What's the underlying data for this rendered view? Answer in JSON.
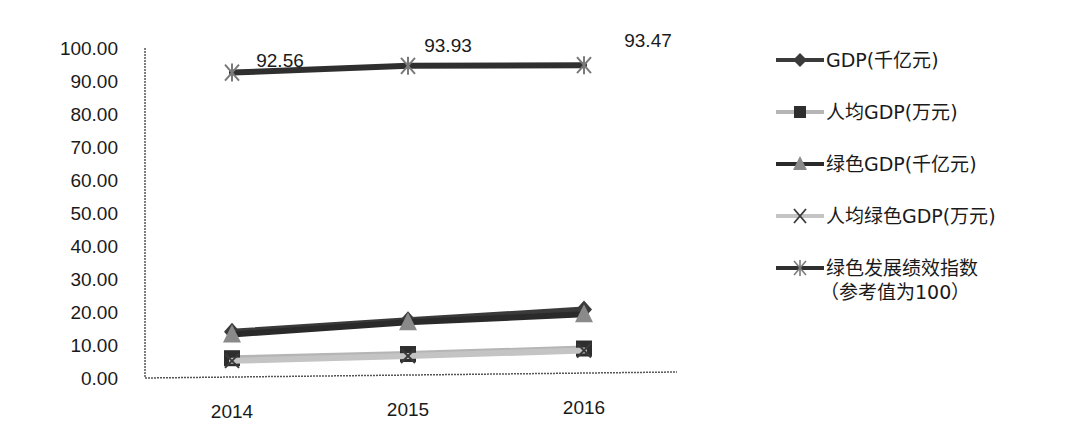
{
  "chart_data": {
    "type": "line",
    "title": "",
    "xlabel": "",
    "ylabel": "",
    "categories": [
      "2014",
      "2015",
      "2016"
    ],
    "ylim": [
      0,
      100
    ],
    "yticks": [
      "0.00",
      "10.00",
      "20.00",
      "30.00",
      "40.00",
      "50.00",
      "60.00",
      "70.00",
      "80.00",
      "90.00",
      "100.00"
    ],
    "grid": false,
    "legend_position": "right",
    "series": [
      {
        "name": "GDP(千亿元)",
        "marker": "diamond",
        "color": "#3a3a3a",
        "values": [
          14.0,
          16.8,
          19.4
        ]
      },
      {
        "name": "人均GDP(万元)",
        "marker": "square",
        "color": "#b5b5b5",
        "marker_color": "#2e2e2e",
        "values": [
          6.0,
          6.6,
          7.6
        ]
      },
      {
        "name": "绿色GDP(千亿元)",
        "marker": "triangle",
        "color": "#2a2a2a",
        "marker_color": "#8a8a8a",
        "values": [
          13.2,
          16.2,
          18.0
        ]
      },
      {
        "name": "人均绿色GDP(万元)",
        "marker": "x",
        "color": "#c4c4c4",
        "marker_color": "#3a3a3a",
        "values": [
          5.2,
          6.0,
          7.0
        ]
      },
      {
        "name": "绿色发展绩效指数（参考值为100）",
        "marker": "star",
        "color": "#2f2f2f",
        "marker_color": "#7a7a7a",
        "values": [
          92.56,
          93.93,
          93.47
        ],
        "data_labels": [
          "92.56",
          "93.93",
          "93.47"
        ]
      }
    ]
  },
  "legend": {
    "items": [
      {
        "label": "GDP(千亿元)"
      },
      {
        "label": "人均GDP(万元)"
      },
      {
        "label": "绿色GDP(千亿元)"
      },
      {
        "label": "人均绿色GDP(万元)"
      },
      {
        "label": "绿色发展绩效指数",
        "sublabel": "（参考值为100）"
      }
    ]
  }
}
